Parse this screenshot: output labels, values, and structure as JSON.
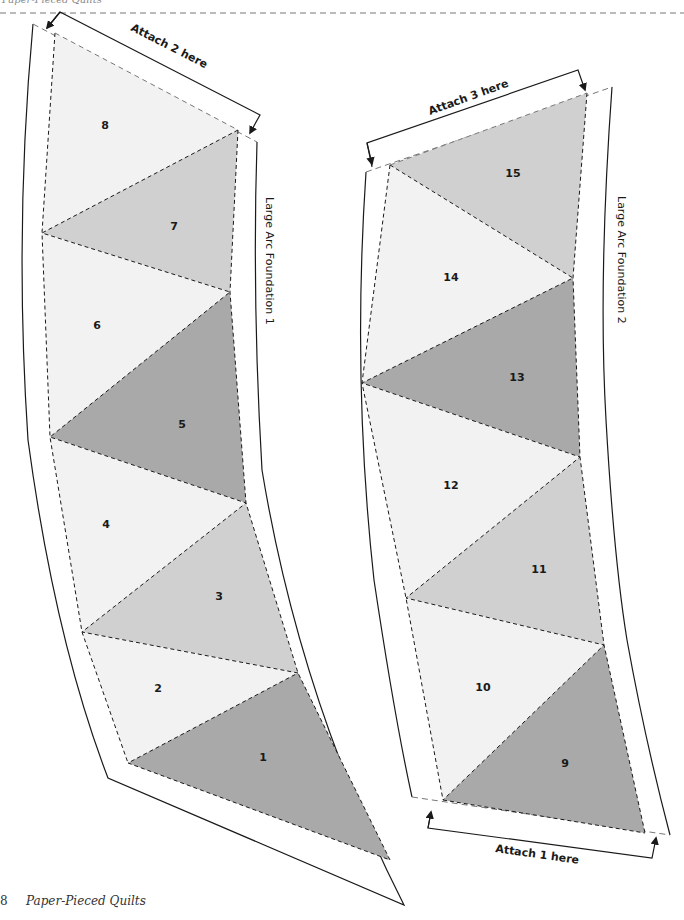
{
  "page": {
    "header_text": "Paper-Pieced Quilts",
    "footer": {
      "page_number": "8",
      "book_title": "Paper-Pieced Quilts"
    }
  },
  "colors": {
    "light": "#f2f2f2",
    "medium": "#d0d0d0",
    "dark": "#a9a9a9",
    "line": "#1a1a1a",
    "seam_dash": "#777777"
  },
  "foundations": [
    {
      "label": "Large Arc Foundation 1",
      "attach_label": "Attach 2 here",
      "pieces": [
        {
          "num": "1",
          "shade": "dark"
        },
        {
          "num": "2",
          "shade": "light"
        },
        {
          "num": "3",
          "shade": "medium"
        },
        {
          "num": "4",
          "shade": "light"
        },
        {
          "num": "5",
          "shade": "dark"
        },
        {
          "num": "6",
          "shade": "light"
        },
        {
          "num": "7",
          "shade": "medium"
        },
        {
          "num": "8",
          "shade": "light"
        }
      ]
    },
    {
      "label": "Large Arc Foundation 2",
      "attach_top_label": "Attach 3 here",
      "attach_bottom_label": "Attach 1 here",
      "pieces": [
        {
          "num": "9",
          "shade": "dark"
        },
        {
          "num": "10",
          "shade": "light"
        },
        {
          "num": "11",
          "shade": "medium"
        },
        {
          "num": "12",
          "shade": "light"
        },
        {
          "num": "13",
          "shade": "dark"
        },
        {
          "num": "14",
          "shade": "light"
        },
        {
          "num": "15",
          "shade": "medium"
        }
      ]
    }
  ]
}
